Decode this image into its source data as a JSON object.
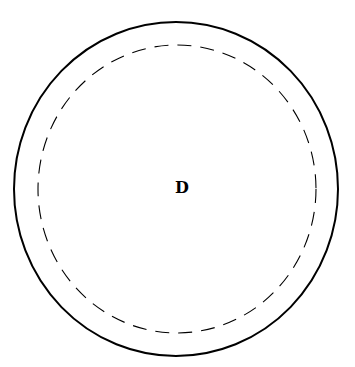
{
  "diagram": {
    "label": "D",
    "outer_circle": {
      "cx": 176,
      "cy": 189,
      "rx": 162,
      "ry": 167,
      "stroke": "#000000",
      "style": "solid"
    },
    "inner_circle": {
      "cx": 177,
      "cy": 189,
      "rx": 139,
      "ry": 144,
      "stroke": "#000000",
      "style": "dashed"
    }
  }
}
